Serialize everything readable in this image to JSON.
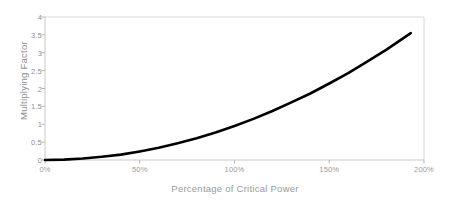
{
  "chart_data": {
    "type": "line",
    "title": "",
    "xlabel": "Percentage of Critical Power",
    "ylabel": "Multiplying Factor",
    "xlim": [
      0,
      200
    ],
    "ylim": [
      0,
      4
    ],
    "grid": false,
    "legend": null,
    "xtick_labels": [
      "0%",
      "50%",
      "100%",
      "150%",
      "200%"
    ],
    "xtick_values": [
      0,
      50,
      100,
      150,
      200
    ],
    "ytick_labels": [
      "0",
      "0.5",
      "1",
      "1.5",
      "2",
      "2.5",
      "3",
      "3.5",
      "4"
    ],
    "ytick_values": [
      0,
      0.5,
      1,
      1.5,
      2,
      2.5,
      3,
      3.5,
      4
    ],
    "series": [
      {
        "name": "Multiplying Factor",
        "color": "#000000",
        "linewidth": 2.6,
        "x": [
          0,
          10,
          20,
          30,
          40,
          50,
          60,
          70,
          80,
          90,
          100,
          110,
          120,
          130,
          140,
          150,
          160,
          170,
          180,
          193
        ],
        "values": [
          0.0,
          0.01,
          0.04,
          0.09,
          0.15,
          0.24,
          0.34,
          0.47,
          0.61,
          0.77,
          0.95,
          1.15,
          1.37,
          1.61,
          1.86,
          2.14,
          2.43,
          2.75,
          3.08,
          3.55
        ]
      }
    ]
  },
  "plot": {
    "axis_color": "#c9c9c9",
    "border_color": "#d8d8d8",
    "tick_color": "#b5b5b5",
    "bg": "#ffffff"
  }
}
